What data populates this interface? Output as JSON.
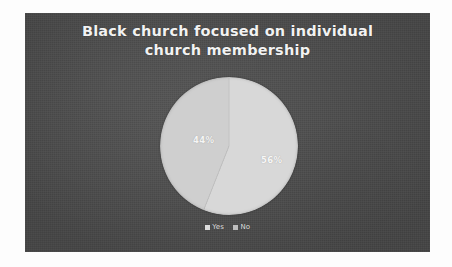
{
  "chart_data": {
    "type": "pie",
    "title": "Black church focused on individual church membership",
    "title_lines": [
      "Black church focused on individual",
      "church membership"
    ],
    "categories": [
      "Yes",
      "No"
    ],
    "values": [
      56,
      44
    ],
    "value_labels": [
      "56%",
      "44%"
    ],
    "unit": "%",
    "legend_position": "bottom",
    "grid": false,
    "xlabel": "",
    "ylabel": "",
    "slices": [
      {
        "label": "Yes",
        "value": 56,
        "value_label": "56%",
        "color": "#d8d8d8",
        "start_angle": 0,
        "sweep_angle": 201.6
      },
      {
        "label": "No",
        "value": 44,
        "value_label": "44%",
        "color": "#cfcfcf",
        "start_angle": 201.6,
        "sweep_angle": 158.4
      }
    ]
  },
  "panel": {
    "background_color": "#4d4d4d"
  },
  "title": {
    "line1": "Black church focused on individual",
    "line2": "church membership",
    "color": "#f2f2f2"
  },
  "pie": {
    "label_yes": "56%",
    "label_no": "44%",
    "yes_color": "#d8d8d8",
    "no_color": "#cfcfcf"
  },
  "legend": {
    "items": [
      {
        "label": "Yes",
        "color": "#d8d8d8"
      },
      {
        "label": "No",
        "color": "#b9b9b9"
      }
    ]
  }
}
